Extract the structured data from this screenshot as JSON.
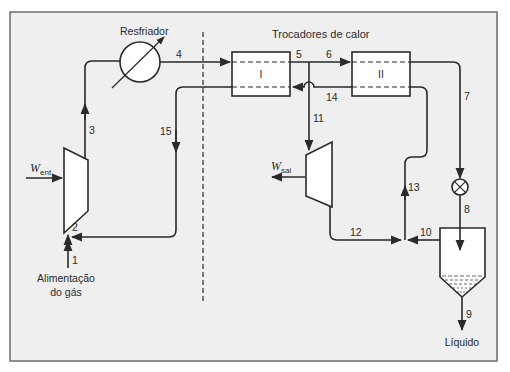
{
  "diagram": {
    "colors": {
      "background": "#efefef",
      "frame": "#6b6b6b",
      "line": "#2a2a2a",
      "equipment_fill": "#ffffff"
    },
    "labels": {
      "cooler": "Resfriador",
      "heat_exchangers": "Trocadores de calor",
      "hx1": "I",
      "hx2": "II",
      "feed_line1": "Alimentação",
      "feed_line2": "do gás",
      "liquid": "Líquido",
      "work_in_main": "W",
      "work_in_sub": "ent",
      "work_out_main": "W",
      "work_out_sub": "sai"
    },
    "streams": {
      "s1": "1",
      "s2": "2",
      "s3": "3",
      "s4": "4",
      "s5": "5",
      "s6": "6",
      "s7": "7",
      "s8": "8",
      "s9": "9",
      "s10": "10",
      "s11": "11",
      "s12": "12",
      "s13": "13",
      "s14": "14",
      "s15": "15"
    },
    "equipment": [
      {
        "id": "compressor",
        "name": "Compressor",
        "icon": "trapezoid"
      },
      {
        "id": "cooler",
        "name": "Resfriador",
        "icon": "circle-with-diagonal-arrow"
      },
      {
        "id": "hx1",
        "name": "Trocador de calor I",
        "icon": "rectangle-dashed"
      },
      {
        "id": "hx2",
        "name": "Trocador de calor II",
        "icon": "rectangle-dashed"
      },
      {
        "id": "expander",
        "name": "Expansor",
        "icon": "trapezoid"
      },
      {
        "id": "valve",
        "name": "Válvula",
        "icon": "circle-x"
      },
      {
        "id": "separator",
        "name": "Separador",
        "icon": "tank-with-cone"
      }
    ]
  }
}
